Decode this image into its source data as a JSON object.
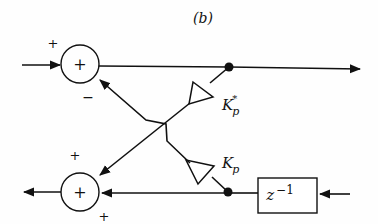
{
  "diagram": {
    "caption": "(b)",
    "type": "lattice filter stage",
    "colors": {
      "stroke": "#111111",
      "background": "#fefefe"
    },
    "nodes": {
      "top_sum": {
        "label": "+",
        "input_signs": {
          "left": "+",
          "lower": "−"
        }
      },
      "bottom_sum": {
        "label": "+",
        "input_signs": {
          "upper": "+",
          "right": "+"
        }
      },
      "delay": {
        "label": "z",
        "exponent": "−1"
      },
      "gain_upper": {
        "label": "K",
        "subscript": "p",
        "superscript": "*"
      },
      "gain_lower": {
        "label": "K",
        "subscript": "p"
      }
    },
    "signs": {
      "top_plus": "+",
      "top_minus": "−",
      "bottom_plus_upper": "+",
      "bottom_plus_lower": "+"
    }
  }
}
